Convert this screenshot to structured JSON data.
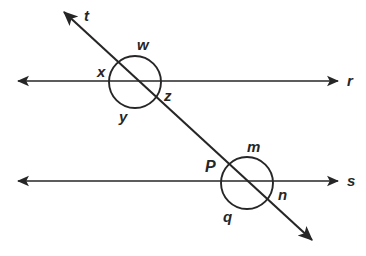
{
  "figure": {
    "kind": "geometry-diagram",
    "width": 366,
    "height": 256,
    "background_color": "#ffffff",
    "stroke_color": "#262626",
    "text_color": "#262626"
  },
  "lines": [
    {
      "id": "line-r",
      "label": "r",
      "label_x": 347,
      "label_y": 73,
      "x1": 18,
      "y1": 81,
      "x2": 338,
      "y2": 81,
      "arrow_start": true,
      "arrow_end": true
    },
    {
      "id": "line-s",
      "label": "s",
      "label_x": 347,
      "label_y": 173,
      "x1": 18,
      "y1": 181,
      "x2": 338,
      "y2": 181,
      "arrow_start": true,
      "arrow_end": true
    },
    {
      "id": "line-t",
      "label": "t",
      "label_x": 84,
      "label_y": 8,
      "x1": 64,
      "y1": 12,
      "x2": 312,
      "y2": 240,
      "arrow_start": true,
      "arrow_end": true
    }
  ],
  "intersections": [
    {
      "id": "upper-intersection",
      "on_line": "r",
      "circle": {
        "cx": 135,
        "cy": 82,
        "r": 26
      },
      "angles": [
        {
          "id": "angle-w",
          "label": "w",
          "x": 137,
          "y": 37,
          "position": "top"
        },
        {
          "id": "angle-x",
          "label": "x",
          "x": 97,
          "y": 64,
          "position": "left"
        },
        {
          "id": "angle-y",
          "label": "y",
          "x": 119,
          "y": 109,
          "position": "bottom"
        },
        {
          "id": "angle-z",
          "label": "z",
          "x": 164,
          "y": 88,
          "position": "right"
        }
      ]
    },
    {
      "id": "lower-intersection",
      "on_line": "s",
      "circle": {
        "cx": 247,
        "cy": 183,
        "r": 26
      },
      "angles": [
        {
          "id": "angle-m",
          "label": "m",
          "x": 247,
          "y": 139,
          "position": "top"
        },
        {
          "id": "angle-p",
          "label": "P",
          "x": 205,
          "y": 159,
          "position": "left"
        },
        {
          "id": "angle-q",
          "label": "q",
          "x": 223,
          "y": 209,
          "position": "bottom"
        },
        {
          "id": "angle-n",
          "label": "n",
          "x": 278,
          "y": 187,
          "position": "right"
        }
      ]
    }
  ]
}
